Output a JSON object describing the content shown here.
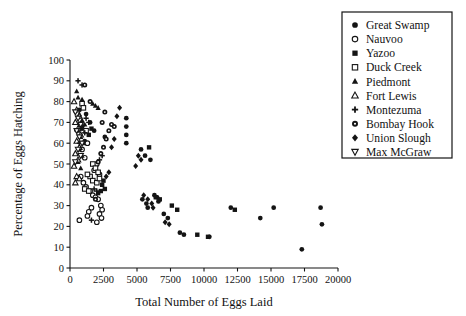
{
  "chart_data": {
    "type": "scatter",
    "title": "",
    "xlabel": "Total Number of Eggs Laid",
    "ylabel": "Percentage of Eggs Hatching",
    "xlim": [
      0,
      20000
    ],
    "ylim": [
      0,
      100
    ],
    "xticks": [
      0,
      2500,
      5000,
      7500,
      10000,
      12500,
      15000,
      17500,
      20000
    ],
    "yticks": [
      0,
      10,
      20,
      30,
      40,
      50,
      60,
      70,
      80,
      90,
      100
    ],
    "xticklabels": [
      "0",
      "2500",
      "5000",
      "7500",
      "10000",
      "12500",
      "15000",
      "17500",
      "20000"
    ],
    "yticklabels": [
      "0",
      "10",
      "20",
      "30",
      "40",
      "50",
      "60",
      "70",
      "80",
      "90",
      "100"
    ],
    "grid": false,
    "legend_position": "upper right",
    "series": [
      {
        "name": "Great Swamp",
        "marker": "filled-circle",
        "points": [
          [
            4200,
            72
          ],
          [
            4200,
            68
          ],
          [
            4200,
            64
          ],
          [
            4200,
            60
          ],
          [
            5300,
            57
          ],
          [
            5600,
            54
          ],
          [
            6000,
            52
          ],
          [
            5400,
            33
          ],
          [
            5700,
            31
          ],
          [
            5800,
            29
          ],
          [
            6300,
            35
          ],
          [
            6500,
            34
          ],
          [
            6600,
            32
          ],
          [
            7000,
            26
          ],
          [
            7300,
            24
          ],
          [
            8200,
            17
          ],
          [
            8500,
            16
          ],
          [
            10400,
            15
          ],
          [
            12000,
            29
          ],
          [
            14200,
            24
          ],
          [
            15200,
            29
          ],
          [
            17300,
            9
          ],
          [
            18700,
            29
          ],
          [
            18800,
            21
          ],
          [
            1500,
            70
          ],
          [
            1200,
            74
          ],
          [
            1800,
            66
          ],
          [
            2600,
            63
          ],
          [
            900,
            67
          ],
          [
            1100,
            61
          ],
          [
            700,
            76
          ]
        ]
      },
      {
        "name": "Nauvoo",
        "marker": "open-circle",
        "points": [
          [
            800,
            44
          ],
          [
            1000,
            41
          ],
          [
            1200,
            39
          ],
          [
            1500,
            37
          ],
          [
            1700,
            35
          ],
          [
            1900,
            34
          ],
          [
            2100,
            33
          ],
          [
            2300,
            30
          ],
          [
            2400,
            28
          ],
          [
            2200,
            26
          ],
          [
            1600,
            29
          ],
          [
            1400,
            27
          ],
          [
            1300,
            25
          ],
          [
            700,
            23
          ],
          [
            2000,
            22
          ],
          [
            2350,
            24
          ],
          [
            1800,
            47
          ],
          [
            2000,
            50
          ],
          [
            2200,
            45
          ],
          [
            1100,
            53
          ],
          [
            900,
            57
          ],
          [
            1300,
            60
          ]
        ]
      },
      {
        "name": "Yazoo",
        "marker": "filled-square",
        "points": [
          [
            5900,
            58
          ],
          [
            6400,
            34
          ],
          [
            6700,
            33
          ],
          [
            7600,
            30
          ],
          [
            8000,
            28
          ],
          [
            9500,
            16
          ],
          [
            10300,
            15
          ],
          [
            12300,
            28
          ],
          [
            2400,
            40
          ],
          [
            2600,
            38
          ],
          [
            2300,
            37
          ],
          [
            2500,
            42
          ],
          [
            2100,
            36
          ],
          [
            1600,
            67
          ],
          [
            1400,
            64
          ]
        ]
      },
      {
        "name": "Duck Creek",
        "marker": "open-square",
        "points": [
          [
            900,
            79
          ],
          [
            1000,
            77
          ],
          [
            1700,
            50
          ],
          [
            1900,
            48
          ],
          [
            2100,
            46
          ],
          [
            1500,
            44
          ],
          [
            1700,
            42
          ],
          [
            2000,
            41
          ],
          [
            2200,
            43
          ],
          [
            1300,
            45
          ],
          [
            1100,
            38
          ],
          [
            1400,
            37
          ],
          [
            800,
            69
          ],
          [
            1200,
            66
          ]
        ]
      },
      {
        "name": "Piedmont",
        "marker": "filled-triangle",
        "points": [
          [
            500,
            85
          ],
          [
            600,
            82
          ],
          [
            900,
            81
          ],
          [
            1700,
            79
          ],
          [
            1900,
            78
          ],
          [
            2100,
            77
          ],
          [
            700,
            74
          ],
          [
            900,
            71
          ],
          [
            1100,
            69
          ],
          [
            600,
            66
          ],
          [
            800,
            63
          ],
          [
            1000,
            60
          ],
          [
            700,
            57
          ],
          [
            900,
            54
          ],
          [
            600,
            51
          ],
          [
            800,
            48
          ]
        ]
      },
      {
        "name": "Fort Lewis",
        "marker": "open-triangle",
        "points": [
          [
            300,
            80
          ],
          [
            500,
            76
          ],
          [
            700,
            73
          ],
          [
            400,
            70
          ],
          [
            600,
            67
          ],
          [
            800,
            64
          ],
          [
            500,
            61
          ],
          [
            700,
            58
          ],
          [
            400,
            55
          ],
          [
            600,
            52
          ],
          [
            300,
            49
          ],
          [
            500,
            44
          ],
          [
            400,
            41
          ],
          [
            700,
            43
          ]
        ]
      },
      {
        "name": "Montezuma",
        "marker": "plus",
        "points": [
          [
            600,
            90
          ],
          [
            900,
            88
          ],
          [
            1200,
            72
          ],
          [
            1400,
            70
          ],
          [
            900,
            68
          ],
          [
            1100,
            65
          ],
          [
            2400,
            54
          ],
          [
            2200,
            52
          ],
          [
            1800,
            38
          ],
          [
            2000,
            37
          ],
          [
            1600,
            23
          ],
          [
            700,
            60
          ],
          [
            500,
            66
          ]
        ]
      },
      {
        "name": "Bombay Hook",
        "marker": "dotted-circle",
        "points": [
          [
            1100,
            88
          ],
          [
            1500,
            80
          ],
          [
            2600,
            75
          ],
          [
            2400,
            70
          ],
          [
            3100,
            69
          ],
          [
            2900,
            66
          ],
          [
            2700,
            62
          ],
          [
            2500,
            58
          ],
          [
            2300,
            55
          ],
          [
            2100,
            51
          ],
          [
            1900,
            33
          ],
          [
            3300,
            68
          ]
        ]
      },
      {
        "name": "Union Slough",
        "marker": "diamond",
        "points": [
          [
            3700,
            77
          ],
          [
            3500,
            73
          ],
          [
            3300,
            62
          ],
          [
            3100,
            58
          ],
          [
            5100,
            54
          ],
          [
            5300,
            52
          ],
          [
            4900,
            49
          ],
          [
            5500,
            35
          ],
          [
            5800,
            33
          ],
          [
            6100,
            31
          ],
          [
            6200,
            29
          ],
          [
            7100,
            22
          ],
          [
            7400,
            21
          ],
          [
            2900,
            46
          ],
          [
            2700,
            44
          ]
        ]
      },
      {
        "name": "Max McGraw",
        "marker": "open-down-triangle",
        "points": [
          [
            400,
            75
          ],
          [
            600,
            72
          ],
          [
            800,
            69
          ],
          [
            500,
            66
          ],
          [
            700,
            63
          ],
          [
            900,
            60
          ],
          [
            600,
            57
          ],
          [
            800,
            54
          ],
          [
            400,
            51
          ]
        ]
      }
    ]
  },
  "legend": {
    "items": [
      {
        "label": "Great Swamp",
        "marker": "filled-circle"
      },
      {
        "label": "Nauvoo",
        "marker": "open-circle"
      },
      {
        "label": "Yazoo",
        "marker": "filled-square"
      },
      {
        "label": "Duck Creek",
        "marker": "open-square"
      },
      {
        "label": "Piedmont",
        "marker": "filled-triangle"
      },
      {
        "label": "Fort Lewis",
        "marker": "open-triangle"
      },
      {
        "label": "Montezuma",
        "marker": "plus"
      },
      {
        "label": "Bombay Hook",
        "marker": "dotted-circle"
      },
      {
        "label": "Union Slough",
        "marker": "diamond"
      },
      {
        "label": "Max McGraw",
        "marker": "open-down-triangle"
      }
    ]
  },
  "colors": {
    "ink": "#141414",
    "background": "#ffffff"
  }
}
